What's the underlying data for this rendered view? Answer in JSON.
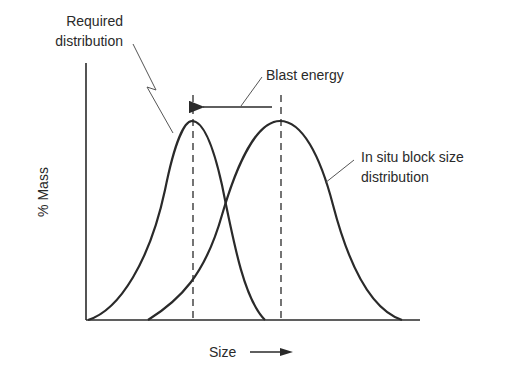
{
  "diagram": {
    "labels": {
      "required_line1": "Required",
      "required_line2": "distribution",
      "blast_energy": "Blast energy",
      "in_situ_line1": "In situ block size",
      "in_situ_line2": "distribution",
      "y_axis": "% Mass",
      "x_axis": "Size"
    },
    "colors": {
      "ink": "#2a2a2a",
      "leader": "#555555",
      "background": "#ffffff"
    },
    "curves": [
      {
        "name": "Required distribution",
        "start_x": 88,
        "peak_x": 192,
        "end_x": 265
      },
      {
        "name": "In situ block size distribution",
        "start_x": 148,
        "peak_x": 280,
        "end_x": 402
      }
    ],
    "arrow": {
      "direction": "left",
      "meaning": "Blast energy shifts distribution to smaller size"
    }
  }
}
